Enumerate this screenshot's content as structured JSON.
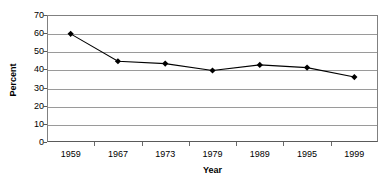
{
  "chart_data": {
    "type": "line",
    "title": "",
    "xlabel": "Year",
    "ylabel": "Percent",
    "categories": [
      "1959",
      "1967",
      "1973",
      "1979",
      "1989",
      "1995",
      "1999"
    ],
    "values": [
      59.6,
      44.5,
      43.2,
      39.4,
      42.5,
      41.0,
      35.8
    ],
    "series": [
      {
        "name": "Percent",
        "values": [
          59.6,
          44.5,
          43.2,
          39.4,
          42.5,
          41.0,
          35.8
        ]
      }
    ],
    "ylim": [
      0,
      70
    ],
    "y_ticks": [
      0,
      10,
      20,
      30,
      40,
      50,
      60,
      70
    ],
    "y_tick_labels": [
      "0",
      "10",
      "20",
      "30",
      "40",
      "50",
      "60",
      "70"
    ],
    "grid": true,
    "legend": "none",
    "line_color": "#000000",
    "marker_color": "#000000",
    "marker": "diamond",
    "gridline_color": "#9a9a9a",
    "plot_border_color": "#808080",
    "background_color": "#ffffff"
  }
}
